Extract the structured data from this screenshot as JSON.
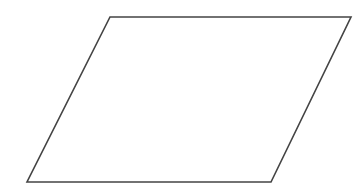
{
  "diagram": {
    "background": "#ffffff",
    "shapes": [
      {
        "type": "parallelogram",
        "points": [
          [
            110,
            17
          ],
          [
            351,
            17
          ],
          [
            271,
            182
          ],
          [
            27,
            182
          ]
        ],
        "stroke": "#444444",
        "stroke_width": 1.6,
        "fill": "#ffffff"
      }
    ]
  }
}
